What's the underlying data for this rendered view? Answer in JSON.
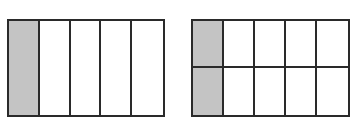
{
  "diagrams": [
    {
      "name": "fraction-grid-left",
      "rows": 1,
      "cols": 5,
      "shaded_cells": [
        [
          0,
          0
        ]
      ],
      "fraction": "1/5",
      "box": {
        "left": 7,
        "top": 19,
        "width": 158,
        "height": 98
      }
    },
    {
      "name": "fraction-grid-right",
      "rows": 2,
      "cols": 5,
      "shaded_cells": [
        [
          0,
          0
        ],
        [
          1,
          0
        ]
      ],
      "fraction": "2/10",
      "box": {
        "left": 191,
        "top": 19,
        "width": 159,
        "height": 98
      }
    }
  ],
  "colors": {
    "shade": "#c4c4c4",
    "line": "#2a2a2a",
    "background": "#ffffff"
  }
}
